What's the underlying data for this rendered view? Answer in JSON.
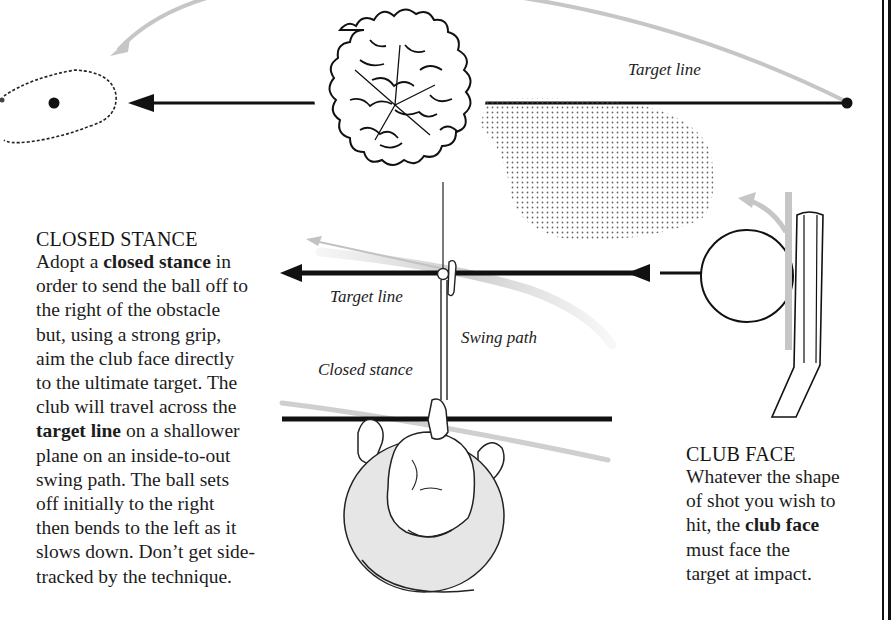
{
  "diagram": {
    "top": {
      "target_line_label": "Target line",
      "elements": [
        "green-with-flag",
        "tree-obstacle",
        "target-line-arrow",
        "ball-start",
        "ball-flight-curve",
        "tree-shadow"
      ]
    },
    "middle": {
      "target_line_label": "Target line",
      "swing_path_label": "Swing path",
      "closed_stance_label": "Closed stance"
    },
    "club_face": {
      "elements": [
        "ball",
        "club-head",
        "direction-arrow",
        "spin-arrow"
      ]
    }
  },
  "closed_stance": {
    "heading": "CLOSED STANCE",
    "body": [
      {
        "text": "Adopt a ",
        "bold": false
      },
      {
        "text": "closed stance",
        "bold": true
      },
      {
        "text": " in order to send the ball off to the right of the obstacle but, using a strong grip, aim the club face directly to the ultimate target. The club will travel across the ",
        "bold": false
      },
      {
        "text": "target line",
        "bold": true
      },
      {
        "text": " on a shallower plane on an inside-to-out swing path. The ball sets off initially to the right then bends to the left as it slows down. Don’t get side-tracked by the technique.",
        "bold": false
      }
    ],
    "lines": [
      "Adopt a |closed stance| in",
      "order to send the ball off to",
      "the right of the obstacle",
      "but, using a strong grip,",
      "aim the club face directly",
      "to the ultimate target. The",
      "club will travel across the",
      "|target line| on a shallower",
      "plane on an inside-to-out",
      "swing path. The ball sets",
      "off initially to the right",
      "then bends to the left as it",
      "slows down. Don’t get side-",
      "tracked by the technique."
    ]
  },
  "club_face": {
    "heading": "CLUB FACE",
    "lines": [
      "Whatever the shape",
      "of shot you wish to",
      "hit, the |club face|",
      "must face the",
      "target at impact."
    ]
  },
  "colors": {
    "ink": "#111111",
    "gray_path": "#c4c4c4",
    "shirt": "#e6e6e6",
    "paper": "#ffffff"
  }
}
